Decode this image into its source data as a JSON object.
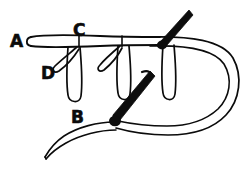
{
  "diagram": {
    "background_color": "#ffffff",
    "ink_color": "#0b0b0b",
    "thread_color": "#111111",
    "needle_fill": "#0d0d0d",
    "labels": [
      {
        "id": "label-a",
        "text": "A",
        "x": 10,
        "y": 47,
        "meaning": "thread-start-point"
      },
      {
        "id": "label-c",
        "text": "C",
        "x": 73,
        "y": 36,
        "meaning": "upper-stitch-point"
      },
      {
        "id": "label-d",
        "text": "D",
        "x": 41,
        "y": 79,
        "meaning": "small-loop-point"
      },
      {
        "id": "label-b",
        "text": "B",
        "x": 71,
        "y": 123,
        "meaning": "lower-stitch-point"
      }
    ],
    "elements": [
      {
        "name": "horizontal-thread",
        "description": "Long horizontal double-line thread running left to right across the top"
      },
      {
        "name": "vertical-loop-1",
        "description": "U-shaped hanging loop below the horizontal thread, left"
      },
      {
        "name": "vertical-loop-2",
        "description": "U-shaped hanging loop below the horizontal thread, middle"
      },
      {
        "name": "vertical-loop-3",
        "description": "U-shaped hanging loop below the horizontal thread, right"
      },
      {
        "name": "small-hook-loop-1",
        "description": "Small angled hook loop near label D"
      },
      {
        "name": "small-hook-loop-2",
        "description": "Small angled hook loop near the middle vertical loop"
      },
      {
        "name": "big-right-loop",
        "description": "Large rounded double-line loop extending to the right edge and returning along the bottom"
      },
      {
        "name": "bottom-thread-tail",
        "description": "Double-line thread tail descending to lower-left with a pointed tip"
      },
      {
        "name": "needle-upper-right",
        "description": "Solid black needle angled down-left, piercing the horizontal thread at the right"
      },
      {
        "name": "needle-lower-middle",
        "description": "Solid black needle angled down-left, piercing the bottom thread"
      }
    ]
  }
}
